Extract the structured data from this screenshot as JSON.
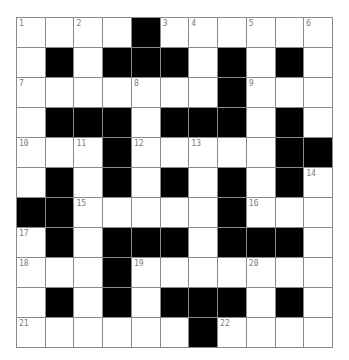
{
  "puzzle": {
    "rows": 11,
    "cols": 11,
    "colors": {
      "block": "#000000",
      "cell": "#ffffff",
      "grid_line": "#8a8a8a",
      "number": "#7a7a7a"
    },
    "layout": [
      "....#......",
      ".#.###.#.#.",
      ".......#...",
      ".###.###.#.",
      "...#.....##",
      ".#.#.#.#.#.",
      "##.....#...",
      ".#.###.###.",
      "...#.......",
      ".#.#.###.#.",
      "......#...."
    ],
    "numbers": [
      {
        "row": 1,
        "col": 1,
        "n": "1"
      },
      {
        "row": 1,
        "col": 3,
        "n": "2"
      },
      {
        "row": 1,
        "col": 6,
        "n": "3"
      },
      {
        "row": 1,
        "col": 7,
        "n": "4"
      },
      {
        "row": 1,
        "col": 9,
        "n": "5"
      },
      {
        "row": 1,
        "col": 11,
        "n": "6"
      },
      {
        "row": 3,
        "col": 1,
        "n": "7"
      },
      {
        "row": 3,
        "col": 5,
        "n": "8"
      },
      {
        "row": 3,
        "col": 9,
        "n": "9"
      },
      {
        "row": 5,
        "col": 1,
        "n": "10"
      },
      {
        "row": 5,
        "col": 3,
        "n": "11"
      },
      {
        "row": 5,
        "col": 5,
        "n": "12"
      },
      {
        "row": 5,
        "col": 7,
        "n": "13"
      },
      {
        "row": 6,
        "col": 11,
        "n": "14"
      },
      {
        "row": 7,
        "col": 3,
        "n": "15"
      },
      {
        "row": 7,
        "col": 9,
        "n": "16"
      },
      {
        "row": 8,
        "col": 1,
        "n": "17"
      },
      {
        "row": 9,
        "col": 1,
        "n": "18"
      },
      {
        "row": 9,
        "col": 5,
        "n": "19"
      },
      {
        "row": 9,
        "col": 9,
        "n": "20"
      },
      {
        "row": 11,
        "col": 1,
        "n": "21"
      },
      {
        "row": 11,
        "col": 8,
        "n": "22"
      }
    ]
  }
}
